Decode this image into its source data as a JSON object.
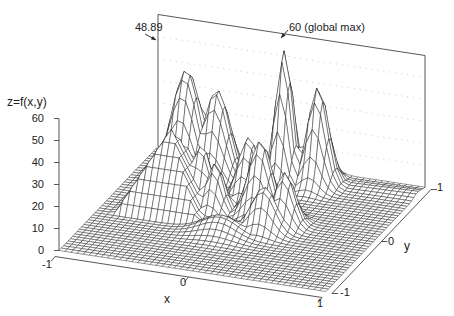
{
  "chart_data": {
    "type": "surface3d",
    "title": "",
    "xlabel": "x",
    "ylabel": "y",
    "zlabel": "z=f(x,y)",
    "xlim": [
      -1,
      1
    ],
    "ylim": [
      -1,
      1
    ],
    "zlim": [
      0,
      60
    ],
    "x_ticks": [
      "-1",
      "0",
      "1"
    ],
    "y_ticks": [
      "-1",
      "0",
      "1"
    ],
    "z_ticks": [
      "0",
      "10",
      "20",
      "30",
      "40",
      "50",
      "60"
    ],
    "grid": true,
    "annotations": [
      {
        "text": "48.89",
        "target": "local max (left peak)",
        "value": 48.89
      },
      {
        "text": "60 (global max)",
        "target": "global maximum",
        "value": 60
      }
    ],
    "surface_description": "Multimodal function on [-1,1]x[-1,1] with several Gaussian-like peaks and plateau/pyramid features; global maximum 60, a prominent local maximum 48.89",
    "peaks": [
      {
        "x": -0.62,
        "y": 0.55,
        "height": 48.89,
        "sx": 0.1,
        "sy": 0.14
      },
      {
        "x": -0.42,
        "y": 0.62,
        "height": 40,
        "sx": 0.09,
        "sy": 0.12
      },
      {
        "x": 0.05,
        "y": 0.72,
        "height": 60,
        "sx": 0.055,
        "sy": 0.1
      },
      {
        "x": 0.28,
        "y": 0.78,
        "height": 44,
        "sx": 0.07,
        "sy": 0.1
      },
      {
        "x": -0.08,
        "y": 0.35,
        "height": 28,
        "sx": 0.07,
        "sy": 0.1
      },
      {
        "x": -0.35,
        "y": 0.12,
        "height": 27,
        "sx": 0.07,
        "sy": 0.09
      },
      {
        "x": -0.22,
        "y": 0.05,
        "height": 22,
        "sx": 0.06,
        "sy": 0.09
      },
      {
        "x": 0.1,
        "y": 0.1,
        "height": 34,
        "sx": 0.08,
        "sy": 0.1
      },
      {
        "x": 0.32,
        "y": 0.0,
        "height": 24,
        "sx": 0.07,
        "sy": 0.09
      },
      {
        "x": 0.22,
        "y": -0.15,
        "height": 20,
        "sx": 0.09,
        "sy": 0.08
      },
      {
        "x": -0.05,
        "y": -0.3,
        "height": 8,
        "sx": 0.14,
        "sy": 0.1
      }
    ],
    "pyramid": {
      "x": -0.55,
      "y": 0.05,
      "height": 35,
      "half_width": 0.32
    }
  },
  "labels": {
    "zlabel": "z=f(x,y)",
    "xlabel": "x",
    "ylabel": "y",
    "annot_left": "48.89",
    "annot_global": "60 (global max)",
    "z_ticks": [
      "60",
      "50",
      "40",
      "30",
      "20",
      "10",
      "0"
    ],
    "x_tick_m1": "-1",
    "x_tick_0": "0",
    "x_tick_1": "1",
    "y_tick_m1": "-1",
    "y_tick_0": "0",
    "y_tick_1": "1"
  },
  "colors": {
    "mesh_line": "#1a1a1a",
    "mesh_fill": "#ffffff",
    "axis": "#444444",
    "grid_dots": "#bbbbbb"
  }
}
